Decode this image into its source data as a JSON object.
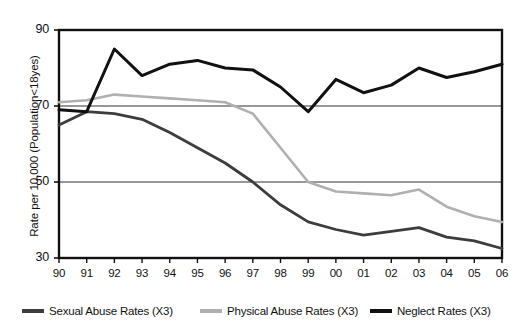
{
  "chart_data": {
    "type": "line",
    "title": "",
    "xlabel": "",
    "ylabel": "Rate per 10,000 (Population<18yes)",
    "x": [
      "90",
      "91",
      "92",
      "93",
      "94",
      "95",
      "96",
      "97",
      "98",
      "99",
      "00",
      "01",
      "02",
      "03",
      "04",
      "05",
      "06"
    ],
    "categories": [
      "90",
      "91",
      "92",
      "93",
      "94",
      "95",
      "96",
      "97",
      "98",
      "99",
      "00",
      "01",
      "02",
      "03",
      "04",
      "05",
      "06"
    ],
    "xlim": [
      0,
      16
    ],
    "ylim": [
      30,
      90
    ],
    "yticks": [
      30,
      50,
      70,
      90
    ],
    "xticks": [
      "90",
      "91",
      "92",
      "93",
      "94",
      "95",
      "96",
      "97",
      "98",
      "99",
      "00",
      "01",
      "02",
      "03",
      "04",
      "05",
      "06"
    ],
    "grid": "horizontal",
    "legend_position": "bottom",
    "series": [
      {
        "name": "Sexual Abuse Rates (X3)",
        "color": "#3d3d3d",
        "values": [
          65.0,
          68.5,
          68.0,
          66.5,
          63.0,
          59.0,
          55.0,
          50.0,
          44.0,
          39.5,
          37.5,
          36.0,
          37.0,
          38.0,
          35.5,
          34.5,
          32.5
        ]
      },
      {
        "name": "Physical Abuse Rates (X3)",
        "color": "#b0b0b0",
        "values": [
          71.0,
          71.5,
          73.0,
          72.5,
          72.0,
          71.5,
          71.0,
          68.0,
          59.0,
          50.0,
          47.5,
          47.0,
          46.5,
          48.0,
          43.5,
          41.0,
          39.5
        ]
      },
      {
        "name": "Neglect Rates (X3)",
        "color": "#111111",
        "values": [
          69.0,
          68.5,
          85.0,
          78.0,
          81.0,
          82.0,
          80.0,
          79.5,
          75.0,
          68.5,
          77.0,
          73.5,
          75.5,
          80.0,
          77.5,
          79.0,
          81.0
        ]
      }
    ]
  },
  "axis": {
    "y_title": "Rate per 10,000 (Population<18yes)",
    "y_labels": [
      "90",
      "70",
      "50",
      "30"
    ],
    "x_labels": [
      "90",
      "91",
      "92",
      "93",
      "94",
      "95",
      "96",
      "97",
      "98",
      "99",
      "00",
      "01",
      "02",
      "03",
      "04",
      "05",
      "06"
    ]
  },
  "legend": {
    "entries": [
      {
        "label": "Sexual Abuse Rates (X3)",
        "color": "#3d3d3d"
      },
      {
        "label": "Physical Abuse Rates (X3)",
        "color": "#b0b0b0"
      },
      {
        "label": "Neglect Rates (X3)",
        "color": "#111111"
      }
    ]
  },
  "colors": {
    "sexual_abuse": "#3d3d3d",
    "physical_abuse": "#b0b0b0",
    "neglect": "#111111",
    "axis": "#111111",
    "gridline": "#333333",
    "background": "#ffffff"
  }
}
